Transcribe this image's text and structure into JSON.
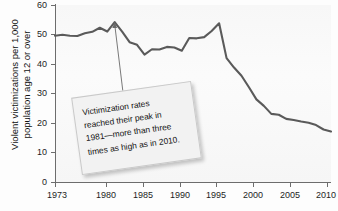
{
  "chart_data": {
    "type": "line",
    "title": "",
    "xlabel": "",
    "ylabel_line1": "Violent victimizations per 1,000",
    "ylabel_line2": "population age 12 or over",
    "ylim": [
      0,
      60
    ],
    "xlim": [
      1973,
      2010
    ],
    "grid": false,
    "legend": "none",
    "line_color": "#5a5a5a",
    "y_ticks": [
      0,
      10,
      20,
      30,
      40,
      50,
      60
    ],
    "x_ticks": [
      1973,
      1980,
      1985,
      1990,
      1995,
      2000,
      2005,
      2010
    ],
    "x_tick_labels": [
      "1973",
      "1980",
      "1985",
      "1990",
      "1995",
      "2000",
      "2005",
      "2010"
    ],
    "series": [
      {
        "name": "Violent victimization rate",
        "x": [
          1973,
          1974,
          1975,
          1976,
          1977,
          1978,
          1979,
          1980,
          1981,
          1982,
          1983,
          1984,
          1985,
          1986,
          1987,
          1988,
          1989,
          1990,
          1991,
          1992,
          1993,
          1994,
          1995,
          1996,
          1997,
          1998,
          1999,
          2000,
          2001,
          2002,
          2003,
          2004,
          2005,
          2006,
          2007,
          2008,
          2009,
          2010
        ],
        "values": [
          49.6,
          49.9,
          49.6,
          49.5,
          50.4,
          50.9,
          52.3,
          51.0,
          54.2,
          51.0,
          47.4,
          46.5,
          43.2,
          45.0,
          44.9,
          45.8,
          45.6,
          44.5,
          48.8,
          48.7,
          49.1,
          51.2,
          53.8,
          42.0,
          38.8,
          36.0,
          32.1,
          28.0,
          25.8,
          23.1,
          22.8,
          21.4,
          21.0,
          20.5,
          20.1,
          19.3,
          17.8,
          17.1
        ]
      }
    ],
    "annotations": [
      {
        "name": "callout",
        "lines": [
          "Victimization rates",
          "reached their peak in",
          "1981—more than three",
          "times as high as in 2010."
        ],
        "arrow_target_year": 1981,
        "arrow_target_value": 54.2
      }
    ]
  }
}
